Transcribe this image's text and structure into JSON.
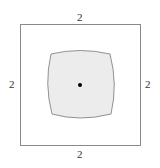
{
  "diagram": {
    "square": {
      "side_labels": {
        "top": "2",
        "bottom": "2",
        "left": "2",
        "right": "2"
      },
      "stroke": "#888888"
    },
    "inner_region": {
      "fill": "#ececec",
      "stroke": "#777777"
    },
    "center_point": {
      "color": "#000000"
    }
  }
}
